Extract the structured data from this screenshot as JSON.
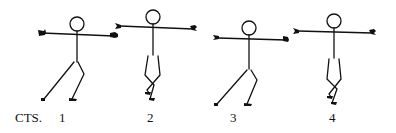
{
  "diagram": {
    "type": "dance-step-notation",
    "counts_label": "CTS.",
    "counts": [
      "1",
      "2",
      "3",
      "4"
    ],
    "figures": [
      {
        "count": "1",
        "pose": "lunge-left, arms extended sideways"
      },
      {
        "count": "2",
        "pose": "standing, legs crossed, arms extended sideways"
      },
      {
        "count": "3",
        "pose": "lunge-left, arms extended sideways"
      },
      {
        "count": "4",
        "pose": "standing, legs crossed, arms extended sideways"
      }
    ],
    "colors": {
      "ink": "#111111",
      "background": "#ffffff"
    }
  }
}
